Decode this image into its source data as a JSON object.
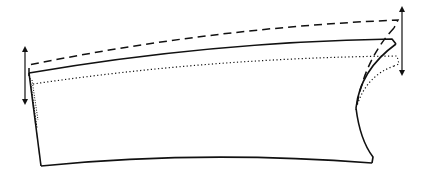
{
  "diagram": {
    "colors": {
      "stroke": "#111111",
      "background": "#ffffff"
    },
    "profiles": [
      {
        "name": "dashed-profile",
        "style": "dashed"
      },
      {
        "name": "solid-profile",
        "style": "solid"
      },
      {
        "name": "dotted-profile",
        "style": "dotted"
      }
    ],
    "arrows": [
      {
        "name": "left-displacement-arrow",
        "type": "double-headed-vertical"
      },
      {
        "name": "right-displacement-arrow",
        "type": "double-headed-vertical"
      }
    ]
  }
}
